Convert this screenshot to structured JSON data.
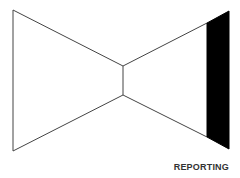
{
  "diagram": {
    "type": "bowtie",
    "label": "REPORTING",
    "colors": {
      "stroke": "#444444",
      "fill_band": "#000000",
      "background": "#ffffff",
      "label": "#333333"
    }
  }
}
